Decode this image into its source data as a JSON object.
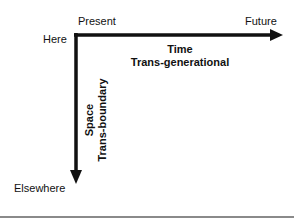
{
  "diagram": {
    "labels": {
      "present": "Present",
      "future": "Future",
      "here": "Here",
      "elsewhere": "Elsewhere"
    },
    "time_axis": {
      "title": "Time",
      "subtitle": "Trans-generational"
    },
    "space_axis": {
      "title": "Space",
      "subtitle": "Trans-boundary"
    },
    "colors": {
      "axis": "#111111",
      "rule": "#8a8a8a",
      "background": "#ffffff"
    }
  }
}
